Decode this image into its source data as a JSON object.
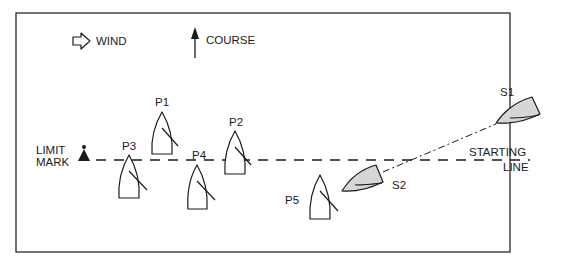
{
  "diagram": {
    "type": "sailing-start-diagram",
    "legend": {
      "wind_label": "WIND",
      "course_label": "COURSE"
    },
    "limit_mark": {
      "label_line1": "LIMIT",
      "label_line2": "MARK"
    },
    "starting_line": {
      "label_line1": "STARTING",
      "label_line2": "LINE"
    },
    "boats": [
      {
        "id": "P1",
        "label": "P1",
        "type": "port",
        "shaded": false
      },
      {
        "id": "P2",
        "label": "P2",
        "type": "port",
        "shaded": false
      },
      {
        "id": "P3",
        "label": "P3",
        "type": "port",
        "shaded": false
      },
      {
        "id": "P4",
        "label": "P4",
        "type": "port",
        "shaded": false
      },
      {
        "id": "P5",
        "label": "P5",
        "type": "port",
        "shaded": false
      },
      {
        "id": "S1",
        "label": "S1",
        "type": "starboard",
        "shaded": true
      },
      {
        "id": "S2",
        "label": "S2",
        "type": "starboard",
        "shaded": true
      }
    ],
    "colors": {
      "ink": "#1a1a1a",
      "starboard_fill": "#d6d6d6",
      "background": "#ffffff"
    }
  }
}
